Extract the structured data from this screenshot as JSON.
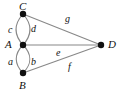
{
  "diagram": {
    "type": "multigraph",
    "title": "",
    "background_color": "#ffffff",
    "edge_color": "#888888",
    "vertex_color": "#101010",
    "label_color": "#111111",
    "vertices": [
      {
        "id": "C",
        "label": "C",
        "x": 23,
        "y": 14,
        "label_x": 19,
        "label_y": 1
      },
      {
        "id": "A",
        "label": "A",
        "x": 23,
        "y": 45,
        "label_x": 5,
        "label_y": 39
      },
      {
        "id": "B",
        "label": "B",
        "x": 23,
        "y": 73,
        "label_x": 19,
        "label_y": 80
      },
      {
        "id": "D",
        "label": "D",
        "x": 101,
        "y": 45,
        "label_x": 108,
        "label_y": 39
      }
    ],
    "edges": [
      {
        "id": "c",
        "label": "c",
        "from": "C",
        "to": "A",
        "shape": "curve-left",
        "label_x": 8,
        "label_y": 25
      },
      {
        "id": "d",
        "label": "d",
        "from": "C",
        "to": "A",
        "shape": "curve-right",
        "label_x": 31,
        "label_y": 24
      },
      {
        "id": "a",
        "label": "a",
        "from": "A",
        "to": "B",
        "shape": "curve-left",
        "label_x": 8,
        "label_y": 57
      },
      {
        "id": "b",
        "label": "b",
        "from": "A",
        "to": "B",
        "shape": "curve-right",
        "label_x": 31,
        "label_y": 57
      },
      {
        "id": "g",
        "label": "g",
        "from": "C",
        "to": "D",
        "shape": "straight",
        "label_x": 65,
        "label_y": 14
      },
      {
        "id": "e",
        "label": "e",
        "from": "A",
        "to": "D",
        "shape": "straight",
        "label_x": 56,
        "label_y": 48
      },
      {
        "id": "f",
        "label": "f",
        "from": "B",
        "to": "D",
        "shape": "straight",
        "label_x": 68,
        "label_y": 62
      }
    ],
    "paths": {
      "c": "M 23 14 C 14 24, 14 35, 23 45",
      "d": "M 23 14 C 32 24, 32 35, 23 45",
      "a": "M 23 45 C 14 54, 14 64, 23 73",
      "b": "M 23 45 C 32 54, 32 64, 23 73",
      "g": "M 23 14 L 101 45",
      "e": "M 23 45 L 101 45",
      "f": "M 23 73 L 101 45"
    }
  }
}
